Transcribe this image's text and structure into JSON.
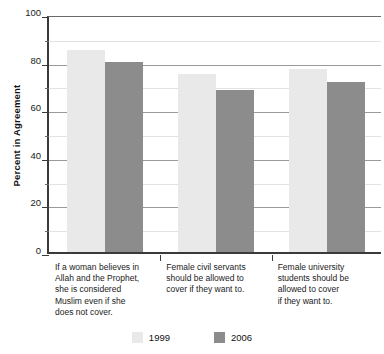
{
  "chart_data": {
    "type": "bar",
    "title": "",
    "xlabel": "",
    "ylabel": "Percent in Agreement",
    "ylim": [
      0,
      100
    ],
    "yticks": [
      0,
      20,
      40,
      60,
      80,
      100
    ],
    "ytick_labels": [
      "0",
      "20",
      "40",
      "60",
      "80",
      "100"
    ],
    "minor_yticks": [
      10,
      30,
      50,
      70,
      90
    ],
    "grid": true,
    "legend_position": "bottom-center",
    "categories": [
      "If a woman believes in Allah and the Prophet, she is considered Muslim even if she does not cover.",
      "Female civil servants should be allowed to cover if they want to.",
      "Female university students should be allowed to cover if they want to."
    ],
    "category_lines": [
      [
        "If a woman believes in",
        "Allah and the Prophet,",
        "she is considered",
        "Muslim even if she",
        "does not cover."
      ],
      [
        "Female civil servants",
        "should be allowed to",
        "cover if they want to."
      ],
      [
        "Female university",
        "students should be",
        "allowed to cover",
        "if they want to."
      ]
    ],
    "series": [
      {
        "name": "1999",
        "color": "#e9e9e9",
        "values": [
          85,
          75,
          77
        ]
      },
      {
        "name": "2006",
        "color": "#8c8c8c",
        "values": [
          80,
          68,
          71.5
        ]
      }
    ]
  },
  "legend": {
    "items": [
      {
        "label": "1999",
        "color": "#e9e9e9"
      },
      {
        "label": "2006",
        "color": "#8c8c8c"
      }
    ]
  },
  "axis": {
    "y_title": "Percent in Agreement"
  }
}
